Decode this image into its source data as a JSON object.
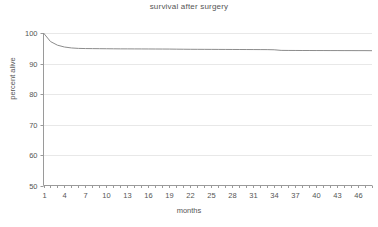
{
  "chart_data": {
    "type": "line",
    "title": "survival after surgery",
    "xlabel": "months",
    "ylabel": "percent alive",
    "xlim": [
      1,
      48
    ],
    "ylim": [
      50,
      100
    ],
    "grid": true,
    "legend": null,
    "y_ticks": [
      50,
      60,
      70,
      80,
      90,
      100
    ],
    "x_ticks": [
      1,
      4,
      7,
      10,
      13,
      16,
      19,
      22,
      25,
      28,
      31,
      34,
      37,
      40,
      43,
      46
    ],
    "x_minor_tick_step": 1,
    "line_color": "#8c8c8c",
    "series": [
      {
        "name": "percent alive",
        "x": [
          1,
          2,
          3,
          4,
          5,
          6,
          7,
          8,
          9,
          10,
          11,
          12,
          13,
          14,
          15,
          16,
          17,
          18,
          19,
          20,
          21,
          22,
          23,
          24,
          25,
          26,
          27,
          28,
          29,
          30,
          31,
          32,
          33,
          34,
          35,
          36,
          37,
          38,
          39,
          40,
          41,
          42,
          43,
          44,
          45,
          46,
          47,
          48
        ],
        "values": [
          100.0,
          97.2,
          96.0,
          95.4,
          95.1,
          94.95,
          94.9,
          94.88,
          94.86,
          94.84,
          94.82,
          94.8,
          94.79,
          94.78,
          94.77,
          94.76,
          94.75,
          94.74,
          94.73,
          94.7,
          94.68,
          94.66,
          94.65,
          94.64,
          94.63,
          94.62,
          94.61,
          94.6,
          94.59,
          94.58,
          94.57,
          94.56,
          94.55,
          94.5,
          94.3,
          94.28,
          94.27,
          94.26,
          94.26,
          94.25,
          94.25,
          94.24,
          94.24,
          94.23,
          94.23,
          94.22,
          94.22,
          94.2
        ]
      }
    ]
  }
}
